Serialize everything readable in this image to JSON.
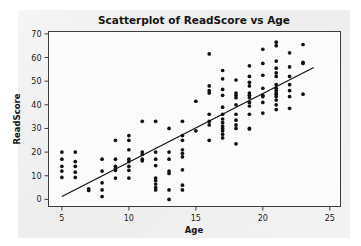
{
  "chart_data": {
    "type": "scatter",
    "title": "Scatterplot of ReadScore vs Age",
    "xlabel": "Age",
    "ylabel": "ReadScore",
    "xlim": [
      4,
      25.8
    ],
    "ylim": [
      -3,
      71
    ],
    "xticks": [
      5,
      10,
      15,
      20,
      25
    ],
    "yticks": [
      0,
      10,
      20,
      30,
      40,
      50,
      60,
      70
    ],
    "xtick_labels": [
      "5",
      "10",
      "15",
      "20",
      "25"
    ],
    "ytick_labels": [
      "0",
      "10",
      "20",
      "30",
      "40",
      "50",
      "60",
      "70"
    ],
    "grid": false,
    "legend": "none",
    "marker": "filled-circle",
    "marker_color": "#101010",
    "fit_line": {
      "label": "regression line",
      "color": "#101010",
      "x_start": 5.0,
      "y_start": 1.2,
      "x_end": 23.8,
      "y_end": 55.8
    },
    "x": [
      5,
      5,
      5,
      5,
      5,
      6,
      6,
      6,
      6,
      6,
      7,
      7,
      8,
      8,
      8,
      8,
      8,
      9,
      9,
      9,
      9,
      9,
      9,
      10,
      10,
      10,
      10,
      10,
      10,
      10,
      10,
      11,
      11,
      11,
      11,
      11,
      12,
      12,
      12,
      12,
      12,
      12,
      12,
      12,
      12,
      13,
      13,
      13,
      13,
      13,
      13,
      13,
      14,
      14,
      14,
      14,
      14,
      14,
      14,
      14,
      14,
      15,
      15,
      16,
      16,
      16,
      16,
      16,
      16,
      16,
      16,
      17,
      17,
      17,
      17,
      17,
      17,
      17,
      17,
      17,
      17,
      17,
      17,
      17,
      18,
      18,
      18,
      18,
      18,
      18,
      18,
      18,
      18,
      18,
      19,
      19,
      19,
      19,
      19,
      19,
      19,
      19,
      19,
      19,
      19,
      19,
      20,
      20,
      20,
      20,
      20,
      20,
      20,
      20,
      21,
      21,
      21,
      21,
      21,
      21,
      21,
      21,
      21,
      21,
      21,
      21,
      21,
      21,
      21,
      22,
      22,
      22,
      22,
      22,
      22,
      22,
      23,
      23,
      23,
      23
    ],
    "y": [
      20.0,
      17.0,
      14.0,
      12.0,
      9.3,
      20.0,
      16.0,
      14.0,
      11.5,
      9.3,
      4.5,
      3.8,
      17.0,
      12.0,
      7.0,
      4.0,
      1.2,
      25.0,
      17.0,
      14.0,
      13.0,
      12.3,
      9.0,
      27.0,
      25.0,
      21.0,
      17.0,
      16.0,
      14.0,
      12.3,
      9.0,
      33.0,
      20.0,
      19.0,
      17.0,
      16.3,
      33.0,
      20.0,
      17.0,
      14.3,
      9.0,
      8.0,
      6.5,
      5.0,
      4.0,
      30.0,
      20.0,
      17.0,
      12.0,
      11.0,
      4.0,
      0.0,
      33.0,
      27.0,
      25.0,
      21.0,
      19.5,
      18.0,
      12.5,
      6.0,
      4.0,
      41.5,
      29.0,
      61.5,
      48.0,
      46.0,
      45.0,
      36.0,
      33.0,
      31.5,
      25.0,
      54.5,
      51.0,
      46.5,
      44.0,
      39.0,
      36.0,
      34.0,
      32.5,
      31.0,
      30.0,
      29.0,
      27.5,
      26.0,
      50.5,
      45.0,
      44.0,
      43.0,
      40.0,
      36.0,
      33.5,
      31.5,
      30.0,
      23.5,
      56.5,
      52.0,
      49.5,
      48.0,
      45.0,
      44.0,
      43.0,
      41.0,
      39.5,
      36.0,
      30.0,
      29.8,
      63.5,
      57.5,
      52.5,
      47.0,
      44.0,
      43.5,
      41.0,
      36.5,
      66.5,
      65.0,
      58.5,
      55.5,
      53.5,
      52.0,
      48.5,
      47.0,
      46.0,
      45.0,
      44.5,
      43.5,
      42.0,
      40.0,
      38.0,
      62.0,
      56.0,
      52.0,
      48.5,
      46.0,
      43.5,
      38.5,
      65.5,
      58.0,
      57.5,
      44.5,
      43.0
    ]
  }
}
